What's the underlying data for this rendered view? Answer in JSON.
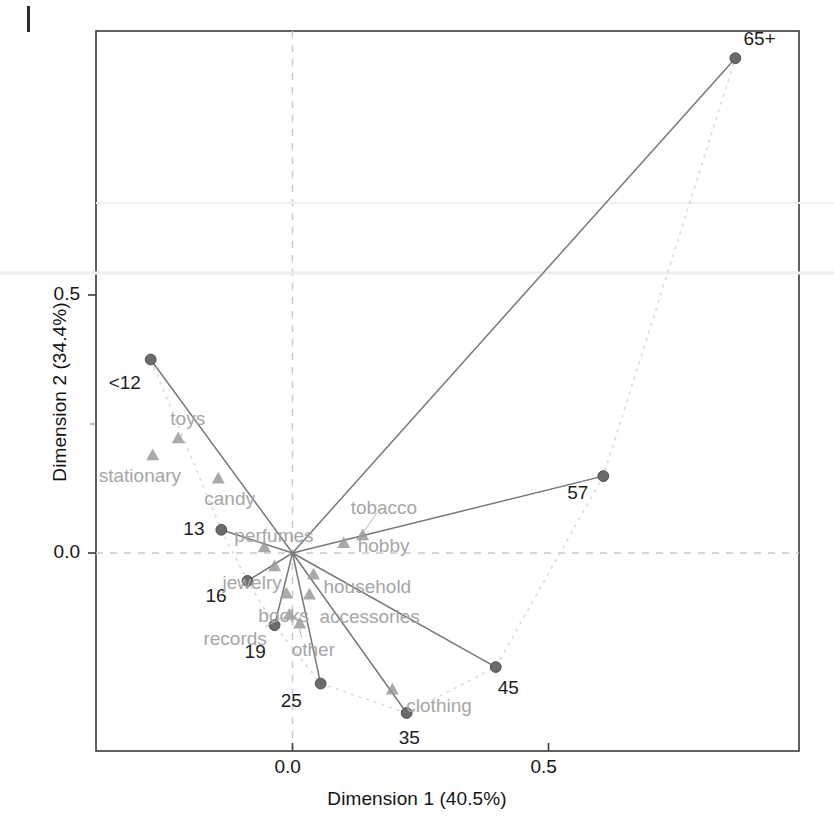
{
  "figure": {
    "page_marker": "page-edge-mark",
    "x_axis": {
      "title": "Dimension 1 (40.5%)",
      "ticks": [
        {
          "value": 0.0,
          "label": "0.0"
        },
        {
          "value": 0.5,
          "label": "0.5"
        }
      ]
    },
    "y_axis": {
      "title": "Dimension 2 (34.4%)",
      "ticks": [
        {
          "value": 0.0,
          "label": "0.0"
        },
        {
          "value": 0.5,
          "label": "0.5"
        }
      ]
    }
  },
  "chart_data": {
    "type": "scatter",
    "title": "",
    "subtitle": "",
    "xlabel": "Dimension 1 (40.5%)",
    "ylabel": "Dimension 2 (34.4%)",
    "xlim": [
      -0.385,
      0.99
    ],
    "ylim": [
      -0.385,
      0.885
    ],
    "xticks": [
      0.0,
      0.5
    ],
    "yticks": [
      0.0,
      0.5
    ],
    "grid": "reference lines at x=0 and y=0 (dashed grey)",
    "legend": "none",
    "annotations": "solid grey rays join the origin to each age-group point; a light dotted curve traces the age-group trajectory from <12 through 65+",
    "series": [
      {
        "name": "age groups",
        "marker": "circle",
        "color": "#6b6b6b",
        "points": [
          {
            "label": "<12",
            "x": -0.277,
            "y": 0.375
          },
          {
            "label": "13",
            "x": -0.139,
            "y": 0.045
          },
          {
            "label": "16",
            "x": -0.088,
            "y": -0.054
          },
          {
            "label": "19",
            "x": -0.035,
            "y": -0.14
          },
          {
            "label": "25",
            "x": 0.055,
            "y": -0.253
          },
          {
            "label": "35",
            "x": 0.223,
            "y": -0.31
          },
          {
            "label": "45",
            "x": 0.397,
            "y": -0.221
          },
          {
            "label": "57",
            "x": 0.607,
            "y": 0.149
          },
          {
            "label": "65+",
            "x": 0.865,
            "y": 0.959
          }
        ]
      },
      {
        "name": "product categories",
        "marker": "triangle",
        "color": "#9a9a9a",
        "points": [
          {
            "label": "toys",
            "x": -0.223,
            "y": 0.223
          },
          {
            "label": "stationary",
            "x": -0.273,
            "y": 0.19
          },
          {
            "label": "candy",
            "x": -0.145,
            "y": 0.145
          },
          {
            "label": "perfumes",
            "x": -0.055,
            "y": 0.012
          },
          {
            "label": "tobacco",
            "x": 0.137,
            "y": 0.035
          },
          {
            "label": "hobby",
            "x": 0.1,
            "y": 0.02
          },
          {
            "label": "household",
            "x": 0.041,
            "y": -0.041
          },
          {
            "label": "jewelry",
            "x": -0.035,
            "y": -0.025
          },
          {
            "label": "books",
            "x": -0.012,
            "y": -0.078
          },
          {
            "label": "accessories",
            "x": 0.033,
            "y": -0.08
          },
          {
            "label": "records",
            "x": -0.006,
            "y": -0.119
          },
          {
            "label": "other",
            "x": 0.014,
            "y": -0.136
          },
          {
            "label": "clothing",
            "x": 0.195,
            "y": -0.264
          }
        ]
      }
    ],
    "trajectory_order": [
      "<12",
      "13",
      "16",
      "19",
      "25",
      "35",
      "45",
      "57",
      "65+"
    ]
  }
}
